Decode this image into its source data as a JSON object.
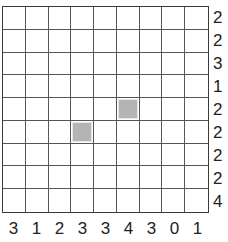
{
  "puzzle": {
    "rows": 9,
    "cols": 9,
    "row_clues": [
      "2",
      "2",
      "3",
      "1",
      "2",
      "2",
      "2",
      "2",
      "4"
    ],
    "col_clues": [
      "3",
      "1",
      "2",
      "3",
      "3",
      "4",
      "3",
      "0",
      "1"
    ],
    "shaded_cells": [
      {
        "row": 4,
        "col": 5
      },
      {
        "row": 5,
        "col": 3
      }
    ],
    "colors": {
      "grid_line": "#555555",
      "border": "#3a3a3a",
      "shaded_fill": "#b4b4b4",
      "background": "#ffffff",
      "clue_text": "#222222"
    }
  }
}
